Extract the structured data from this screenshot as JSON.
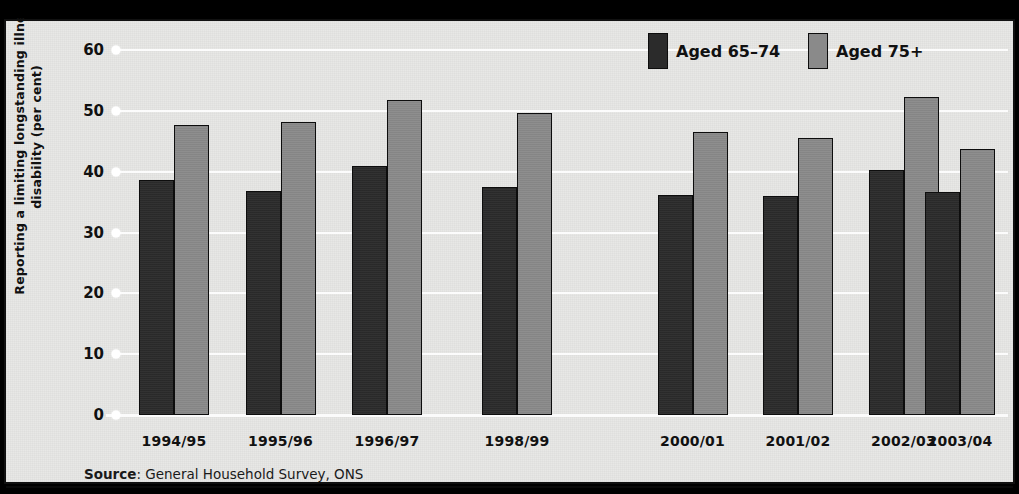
{
  "chart_data": {
    "type": "bar",
    "title": "",
    "xlabel": "",
    "ylabel": "Reporting a limiting longstanding illness or disability (per cent)",
    "ylim": [
      0,
      60
    ],
    "yticks": [
      0,
      10,
      20,
      30,
      40,
      50,
      60
    ],
    "ytick_labels": [
      "0",
      "10",
      "20",
      "30",
      "40",
      "50",
      "60"
    ],
    "grid": true,
    "legend_position": "top-right",
    "categories": [
      "1994/95",
      "1995/96",
      "1996/97",
      "1998/99",
      "2000/01",
      "2001/02",
      "2002/03",
      "2003/04"
    ],
    "series": [
      {
        "name": "Aged 65–74",
        "color": "#2b2b2b",
        "values": [
          38.6,
          36.8,
          40.9,
          37.4,
          36.2,
          36.0,
          40.2,
          36.6
        ]
      },
      {
        "name": "Aged 75+",
        "color": "#8a8a8a",
        "values": [
          47.6,
          48.2,
          51.8,
          49.7,
          46.6,
          45.6,
          52.2,
          43.7
        ]
      }
    ]
  },
  "legend": {
    "items": [
      {
        "label": "Aged 65–74",
        "swatch": "dark-swatch"
      },
      {
        "label": "Aged 75+",
        "swatch": "grey-swatch"
      }
    ]
  },
  "source": {
    "label": "Source",
    "separator": ": ",
    "text": "General Household Survey, ONS"
  },
  "colors": {
    "series_dark": "#2b2b2b",
    "series_grey": "#8a8a8a",
    "background": "#e8e8e6",
    "gridline": "#fdfdfd",
    "frame": "#111111"
  }
}
